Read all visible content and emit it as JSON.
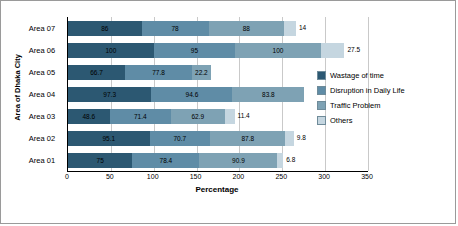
{
  "chart_data": {
    "type": "bar",
    "orientation": "horizontal",
    "stacked": true,
    "title": "",
    "xlabel": "Percentage",
    "ylabel": "Area of Dhaka City",
    "xlim": [
      0,
      350
    ],
    "xticks": [
      0,
      50,
      100,
      150,
      200,
      250,
      300,
      350
    ],
    "grid": true,
    "legend_position": "right",
    "categories": [
      "Area 01",
      "Area 02",
      "Area 03",
      "Area 04",
      "Area 05",
      "Area 06",
      "Area 07"
    ],
    "series": [
      {
        "name": "Wastage of time",
        "color": "#2c5872",
        "values": [
          75,
          95.1,
          48.6,
          97.3,
          66.7,
          100,
          86
        ]
      },
      {
        "name": "Disruption in Daily Life",
        "color": "#5f8ca6",
        "values": [
          78.4,
          70.7,
          71.4,
          94.6,
          77.8,
          95,
          78
        ]
      },
      {
        "name": "Traffic Problem",
        "color": "#7ea2b4",
        "values": [
          90.9,
          87.8,
          62.9,
          83.8,
          22.2,
          100,
          88
        ]
      },
      {
        "name": "Others",
        "color": "#c5d6e0",
        "values": [
          6.8,
          9.8,
          11.4,
          0,
          0,
          27.5,
          14
        ]
      }
    ]
  },
  "legend": {
    "items": [
      {
        "label": "Wastage of time"
      },
      {
        "label": "Disruption in Daily Life"
      },
      {
        "label": "Traffic Problem"
      },
      {
        "label": "Others"
      }
    ]
  }
}
